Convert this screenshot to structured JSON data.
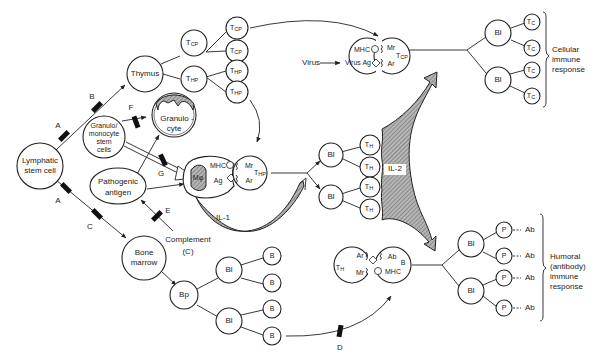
{
  "nodes": {
    "lymphatic_stem_cell": [
      "Lymphatic",
      "stem cell"
    ],
    "thymus": "Thymus",
    "granulo_stem": [
      "Granulo/",
      "monocyte",
      "stem",
      "cells"
    ],
    "granulocyte": [
      "Granulo -",
      "cyte"
    ],
    "pathogenic_antigen": [
      "Pathogenic",
      "antigen"
    ],
    "bone_marrow": [
      "Bone",
      "marrow"
    ],
    "complement": [
      "Complement",
      "(C)"
    ],
    "bp": "Bp",
    "bl": "Bl",
    "b": "B",
    "p": "P",
    "ab": "Ab",
    "t_main": "T",
    "cp_sub": "CP",
    "hp_sub": "HP",
    "h_sub": "H",
    "c_sub": "C",
    "virus": "Virus",
    "virus_ag": "Virus Ag",
    "mhc": "MHC",
    "mr": "Mr",
    "ar": "Ar",
    "ag": "Ag",
    "mphi": "Mφ",
    "il1": "IL-1",
    "il2": "IL-2"
  },
  "blockers": [
    "A",
    "B",
    "A",
    "C",
    "F",
    "G",
    "E",
    "D"
  ],
  "responses": {
    "cellular": [
      "Cellular",
      "immune",
      "response"
    ],
    "humoral": [
      "Humoral",
      "(antibody)",
      "immune",
      "response"
    ]
  },
  "colors": {
    "stroke": "#222222",
    "hatch_fill": "#9a9a9a",
    "blocker": "#111111"
  }
}
